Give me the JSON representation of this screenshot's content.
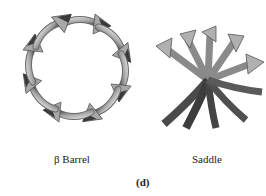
{
  "figure": {
    "panel_label": "(d)",
    "structures": [
      {
        "name": "beta-barrel",
        "label": "β Barrel",
        "strand_count": 8
      },
      {
        "name": "saddle",
        "label": "Saddle",
        "strand_count": 10
      }
    ]
  },
  "colors": {
    "background": "#ffffff",
    "ribbon_light": "#b8b8b8",
    "ribbon_mid": "#8a8a8a",
    "ribbon_dark": "#3a3a3a",
    "text": "#222222"
  }
}
